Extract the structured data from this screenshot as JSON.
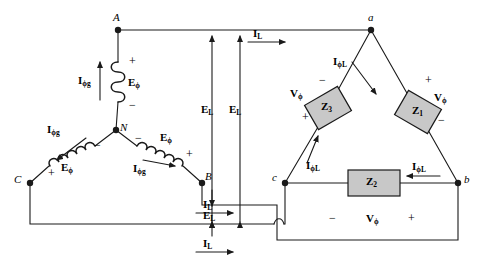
{
  "figure": {
    "type": "electrical-circuit-diagram",
    "stroke_color": "#1a1a1a",
    "impedance_fill": "#c8c8c8"
  },
  "source": {
    "label": "wye-source",
    "nodes": [
      {
        "id": "A",
        "label": "A",
        "x": 118,
        "y": 30
      },
      {
        "id": "B",
        "label": "B",
        "x": 202,
        "y": 183
      },
      {
        "id": "C",
        "label": "C",
        "x": 30,
        "y": 183
      },
      {
        "id": "N",
        "label": "N",
        "x": 116,
        "y": 130
      }
    ],
    "coils": [
      {
        "id": "coil-a",
        "voltage_label": "E",
        "voltage_sub": "ϕ",
        "current_label": "I",
        "current_sub": "ϕg",
        "plus": "+",
        "minus": "−"
      },
      {
        "id": "coil-b",
        "voltage_label": "E",
        "voltage_sub": "ϕ",
        "current_label": "I",
        "current_sub": "ϕg",
        "plus": "+",
        "minus": "−"
      },
      {
        "id": "coil-c",
        "voltage_label": "E",
        "voltage_sub": "ϕ",
        "current_label": "I",
        "current_sub": "ϕg",
        "plus": "+",
        "minus": "−"
      }
    ]
  },
  "load": {
    "label": "delta-load",
    "nodes": [
      {
        "id": "a",
        "label": "a",
        "x": 371,
        "y": 30
      },
      {
        "id": "b",
        "label": "b",
        "x": 458,
        "y": 183
      },
      {
        "id": "c",
        "label": "c",
        "x": 285,
        "y": 183
      }
    ],
    "impedances": [
      {
        "id": "Z1",
        "label": "Z",
        "sub": "1",
        "branch": "a-b"
      },
      {
        "id": "Z2",
        "label": "Z",
        "sub": "2",
        "branch": "c-b"
      },
      {
        "id": "Z3",
        "label": "Z",
        "sub": "3",
        "branch": "a-c"
      }
    ],
    "phase_voltages": [
      {
        "id": "vphi-z1",
        "label": "V",
        "sub": "ϕ",
        "plus": "+",
        "minus": "−"
      },
      {
        "id": "vphi-z2",
        "label": "V",
        "sub": "ϕ",
        "plus": "+",
        "minus": "−"
      },
      {
        "id": "vphi-z3",
        "label": "V",
        "sub": "ϕ",
        "plus": "+",
        "minus": "−"
      }
    ],
    "phase_currents": [
      {
        "id": "iphil-z1",
        "label": "I",
        "sub": "ϕL"
      },
      {
        "id": "iphil-z2",
        "label": "I",
        "sub": "ϕL"
      },
      {
        "id": "iphil-z3",
        "label": "I",
        "sub": "ϕL"
      }
    ]
  },
  "lines": {
    "line_currents": [
      {
        "id": "il-top",
        "label": "I",
        "sub": "L"
      },
      {
        "id": "il-mid",
        "label": "I",
        "sub": "L"
      },
      {
        "id": "il-bottom",
        "label": "I",
        "sub": "L"
      }
    ],
    "line_voltages": [
      {
        "id": "el-left",
        "label": "E",
        "sub": "L"
      },
      {
        "id": "el-right",
        "label": "E",
        "sub": "L"
      },
      {
        "id": "el-bottom",
        "label": "E",
        "sub": "L"
      }
    ]
  }
}
